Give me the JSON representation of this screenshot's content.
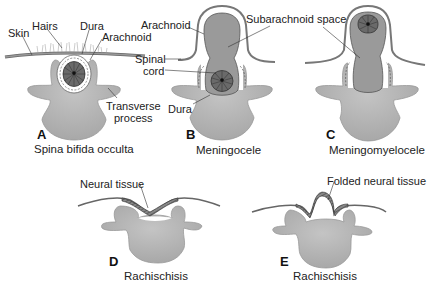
{
  "colors": {
    "background": "#ffffff",
    "vertebra_fill": "#b8b8b8",
    "sac_fill": "#9a9a9a",
    "cord_fill": "#6e6e6e",
    "line": "#555555"
  },
  "panels": [
    {
      "letter": "A",
      "caption": "Spina bifida occulta",
      "labels": [
        "Skin",
        "Hairs",
        "Dura",
        "Arachnoid",
        "Transverse",
        "process"
      ]
    },
    {
      "letter": "B",
      "caption": "Meningocele",
      "labels": [
        "Arachnoid",
        "Subarachnoid space",
        "Spinal",
        "cord",
        "Dura"
      ]
    },
    {
      "letter": "C",
      "caption": "Meningomyelocele",
      "labels": []
    },
    {
      "letter": "D",
      "caption": "Rachischisis",
      "labels": [
        "Neural tissue"
      ]
    },
    {
      "letter": "E",
      "caption": "Rachischisis",
      "labels": [
        "Folded neural tissue"
      ]
    }
  ]
}
